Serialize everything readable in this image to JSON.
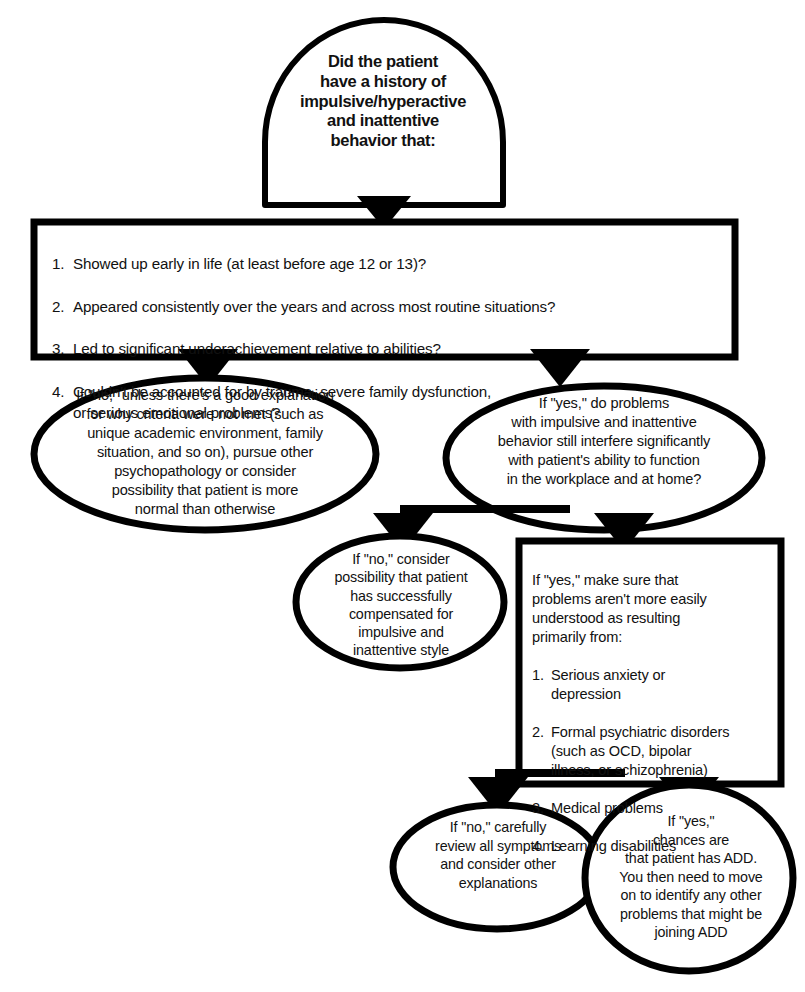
{
  "diagram": {
    "stroke_color": "#000000",
    "fill_color": "#ffffff"
  },
  "nodes": {
    "question": {
      "shape": "dome",
      "text": "Did the patient\nhave a history of\nimpulsive/hyperactive\nand inattentive\nbehavior that:"
    },
    "criteria": {
      "shape": "rectangle",
      "items": [
        {
          "num": "1.",
          "text": "Showed up early in life (at least before age 12 or 13)?"
        },
        {
          "num": "2.",
          "text": "Appeared consistently over the years and across most routine situations?"
        },
        {
          "num": "3.",
          "text": "Led to significant underachievement relative to abilities?"
        },
        {
          "num": "4.",
          "text": "Couldn't be accounted for by trauma, severe family dysfunction,\nor serious emotional problems?"
        }
      ]
    },
    "left_no": {
      "shape": "ellipse",
      "text": "If \"no,\" unless there's a good explanation\nfor why criteria were not met (such as\nunique academic environment, family\nsituation, and so on), pursue other\npsychopathology or consider\npossibility that patient is more\nnormal than otherwise"
    },
    "right_yes": {
      "shape": "ellipse",
      "text": "If \"yes,\" do problems\nwith impulsive and inattentive\nbehavior still interfere significantly\nwith patient's ability to function\nin the workplace and at home?"
    },
    "mid_no": {
      "shape": "ellipse",
      "text": "If \"no,\" consider\npossibility that patient\nhas successfully\ncompensated for\nimpulsive and\ninattentive style"
    },
    "yes_box": {
      "shape": "rectangle",
      "intro": "If \"yes,\" make sure that\nproblems aren't more easily\nunderstood as resulting\nprimarily from:",
      "items": [
        {
          "num": "1.",
          "text": "Serious anxiety or\ndepression"
        },
        {
          "num": "2.",
          "text": "Formal psychiatric disorders\n(such as OCD, bipolar\nillness, or schizophrenia)"
        },
        {
          "num": "3.",
          "text": "Medical problems"
        },
        {
          "num": "4.",
          "text": "Learning disabilities"
        }
      ]
    },
    "bottom_no": {
      "shape": "ellipse",
      "text": "If \"no,\" carefully\nreview all symptoms\nand consider other\nexplanations"
    },
    "bottom_yes": {
      "shape": "ellipse",
      "text": "If \"yes,\"\nchances are\nthat patient has ADD.\nYou then need to move\non to identify any other\nproblems that might be\njoining ADD"
    }
  },
  "connectors": [
    {
      "name": "question-to-criteria",
      "from": "question",
      "to": "criteria"
    },
    {
      "name": "criteria-to-left-no",
      "from": "criteria",
      "to": "left_no"
    },
    {
      "name": "criteria-to-right-yes",
      "from": "criteria",
      "to": "right_yes"
    },
    {
      "name": "right-yes-to-mid-no",
      "from": "right_yes",
      "to": "mid_no"
    },
    {
      "name": "right-yes-to-yes-box",
      "from": "right_yes",
      "to": "yes_box"
    },
    {
      "name": "yes-box-to-bottom-no",
      "from": "yes_box",
      "to": "bottom_no"
    },
    {
      "name": "yes-box-to-bottom-yes",
      "from": "yes_box",
      "to": "bottom_yes"
    }
  ]
}
